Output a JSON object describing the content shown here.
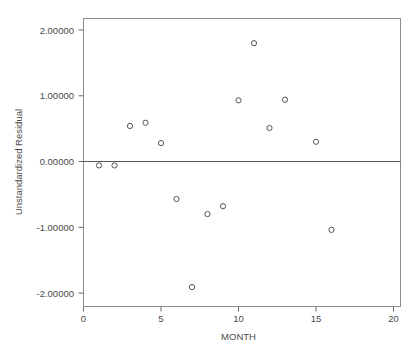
{
  "chart_data": {
    "type": "scatter",
    "title": "",
    "xlabel": "MONTH",
    "ylabel": "Unstandardized Residual",
    "xlim": [
      -0.9,
      20.5
    ],
    "ylim": [
      -2.45,
      2.2
    ],
    "grid": false,
    "legend": "none",
    "x_ticks": [
      "0",
      "5",
      "10",
      "15",
      "20"
    ],
    "x_tick_values": [
      0,
      5,
      10,
      15,
      20
    ],
    "y_ticks": [
      "2.00000",
      "1.00000",
      "0.00000",
      "-1.00000",
      "-2.00000"
    ],
    "y_tick_values": [
      2.0,
      1.0,
      0.0,
      -1.0,
      -2.0
    ],
    "reference_line_y": 0.0,
    "marker": "open-circle",
    "x": [
      1,
      2,
      3,
      4,
      5,
      6,
      7,
      8,
      9,
      10,
      11,
      12,
      13,
      15,
      16
    ],
    "y": [
      -0.06,
      -0.06,
      0.54,
      0.59,
      0.28,
      -0.57,
      -1.91,
      -0.8,
      -0.68,
      0.93,
      1.8,
      0.51,
      0.94,
      0.3,
      -1.04
    ],
    "points": [
      {
        "x": 1,
        "y": -0.06
      },
      {
        "x": 2,
        "y": -0.06
      },
      {
        "x": 3,
        "y": 0.54
      },
      {
        "x": 4,
        "y": 0.59
      },
      {
        "x": 5,
        "y": 0.28
      },
      {
        "x": 6,
        "y": -0.57
      },
      {
        "x": 7,
        "y": -1.91
      },
      {
        "x": 8,
        "y": -0.8
      },
      {
        "x": 9,
        "y": -0.68
      },
      {
        "x": 10,
        "y": 0.93
      },
      {
        "x": 11,
        "y": 1.8
      },
      {
        "x": 12,
        "y": 0.51
      },
      {
        "x": 13,
        "y": 0.94
      },
      {
        "x": 15,
        "y": 0.3
      },
      {
        "x": 16,
        "y": -1.04
      }
    ],
    "colors": {
      "marker_stroke": "#555555",
      "frame": "#8c8c8c",
      "zero_line": "#5a5a5a",
      "text": "#4a4a4a",
      "background": "#ffffff"
    }
  },
  "axes": {
    "y_label": "Unstandardized Residual",
    "x_label": "MONTH",
    "y_tick_0": "2.00000",
    "y_tick_1": "1.00000",
    "y_tick_2": "0.00000",
    "y_tick_3": "-1.00000",
    "y_tick_4": "-2.00000",
    "x_tick_0": "0",
    "x_tick_1": "5",
    "x_tick_2": "10",
    "x_tick_3": "15",
    "x_tick_4": "20"
  }
}
